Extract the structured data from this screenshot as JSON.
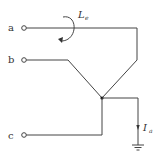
{
  "diagram": {
    "type": "circuit-schematic",
    "terminals": [
      {
        "id": "a",
        "label": "a"
      },
      {
        "id": "b",
        "label": "b"
      },
      {
        "id": "c",
        "label": "c"
      }
    ],
    "loop_label": {
      "main": "L",
      "sub": "e"
    },
    "current_label": {
      "main": "I",
      "sub": "a"
    },
    "colors": {
      "wire": "#444444",
      "background": "#ffffff"
    }
  }
}
